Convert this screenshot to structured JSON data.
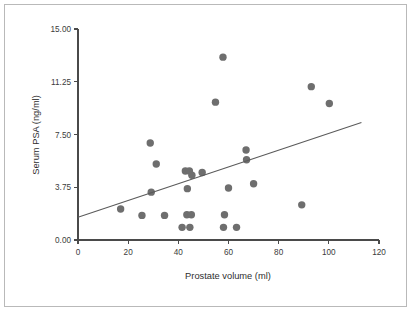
{
  "figure": {
    "background_color": "#ffffff",
    "border_color": "#b9b9b9",
    "marker_color": "#6e6e6e",
    "line_color": "#5a5a5a",
    "axis_color": "#4a4a4a"
  },
  "chart_data": {
    "type": "scatter",
    "title": "",
    "xlabel": "Prostate volume (ml)",
    "ylabel": "Serum PSA (ng/ml)",
    "xlim": [
      0,
      120
    ],
    "ylim": [
      0,
      15
    ],
    "xticks": [
      0,
      20,
      40,
      60,
      80,
      100,
      120
    ],
    "xtick_labels": [
      "0",
      "20",
      "40",
      "60",
      "80",
      "100",
      "120"
    ],
    "yticks": [
      0,
      3.75,
      7.5,
      11.25,
      15
    ],
    "ytick_labels": [
      "0.00",
      "3.75",
      "7.50",
      "11.25",
      "15.00"
    ],
    "grid": false,
    "legend": "none",
    "points": [
      {
        "x": 17.0,
        "y": 2.2
      },
      {
        "x": 25.5,
        "y": 1.75
      },
      {
        "x": 28.8,
        "y": 6.9
      },
      {
        "x": 29.2,
        "y": 3.4
      },
      {
        "x": 31.2,
        "y": 5.4
      },
      {
        "x": 34.5,
        "y": 1.75
      },
      {
        "x": 41.5,
        "y": 0.9
      },
      {
        "x": 42.8,
        "y": 4.9
      },
      {
        "x": 43.4,
        "y": 1.8
      },
      {
        "x": 43.6,
        "y": 3.65
      },
      {
        "x": 44.4,
        "y": 4.9
      },
      {
        "x": 44.6,
        "y": 0.9
      },
      {
        "x": 45.2,
        "y": 1.8
      },
      {
        "x": 45.4,
        "y": 4.6
      },
      {
        "x": 49.5,
        "y": 4.8
      },
      {
        "x": 54.8,
        "y": 9.8
      },
      {
        "x": 57.8,
        "y": 13.0
      },
      {
        "x": 58.0,
        "y": 0.9
      },
      {
        "x": 58.4,
        "y": 1.8
      },
      {
        "x": 60.0,
        "y": 3.7
      },
      {
        "x": 63.2,
        "y": 0.9
      },
      {
        "x": 67.0,
        "y": 6.4
      },
      {
        "x": 67.2,
        "y": 5.7
      },
      {
        "x": 70.0,
        "y": 4.0
      },
      {
        "x": 89.2,
        "y": 2.5
      },
      {
        "x": 93.0,
        "y": 10.9
      },
      {
        "x": 100.2,
        "y": 9.7
      }
    ],
    "fit_line": {
      "x_start": 0,
      "y_start": 1.62,
      "x_end": 113,
      "y_end": 8.35
    }
  }
}
